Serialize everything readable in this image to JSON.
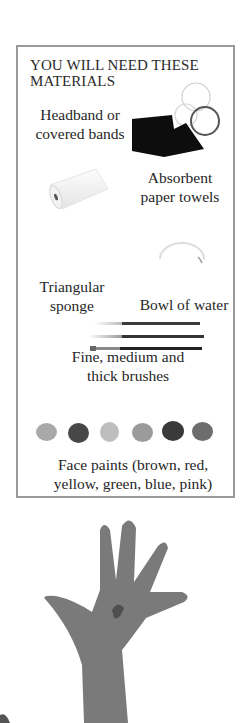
{
  "panel": {
    "title_line1": "YOU WILL NEED THESE",
    "title_line2": "MATERIALS",
    "items": [
      {
        "line1": "Headband or",
        "line2": "covered bands",
        "icon": "headband-icon"
      },
      {
        "line1": "Absorbent",
        "line2": "paper towels",
        "icon": "paper-towel-icon"
      },
      {
        "line1": "Triangular",
        "line2": "sponge",
        "icon": "sponge-icon"
      },
      {
        "line1": "Bowl of water",
        "line2": "",
        "icon": "bowl-icon"
      },
      {
        "line1": "Fine, medium and",
        "line2": "thick brushes",
        "icon": "brushes-icon"
      },
      {
        "line1": "Face paints (brown, red,",
        "line2": "yellow, green, blue, pink)",
        "icon": "face-paints-icon"
      }
    ],
    "paint_swatches": [
      {
        "name": "brown",
        "color": "#a8a8a8"
      },
      {
        "name": "red",
        "color": "#4a4a4a"
      },
      {
        "name": "yellow",
        "color": "#bdbdbd"
      },
      {
        "name": "green",
        "color": "#9a9a9a"
      },
      {
        "name": "blue",
        "color": "#3c3c3c"
      },
      {
        "name": "pink",
        "color": "#6e6e6e"
      }
    ],
    "border_color": "#9a9a9a"
  },
  "photo": {
    "subject": "raised-hand-photo"
  }
}
